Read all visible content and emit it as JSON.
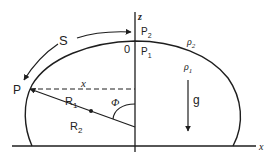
{
  "diagram": {
    "colors": {
      "stroke": "#1e1e1e",
      "background": "#ffffff"
    },
    "labels": {
      "z_axis": "z",
      "x_axis": "x",
      "origin": "0",
      "arc_length": "S",
      "point": "P",
      "horizontal_distance": "x",
      "radius_1": "R",
      "radius_1_sub": "1",
      "radius_2": "R",
      "radius_2_sub": "2",
      "angle": "Φ",
      "gravity": "g",
      "pressure_top_outer": "P",
      "pressure_top_outer_sub": "2",
      "pressure_top_inner": "P",
      "pressure_top_inner_sub": "1",
      "density_outer": "ρ",
      "density_outer_sub": "2",
      "density_inner": "ρ",
      "density_inner_sub": "1"
    }
  }
}
